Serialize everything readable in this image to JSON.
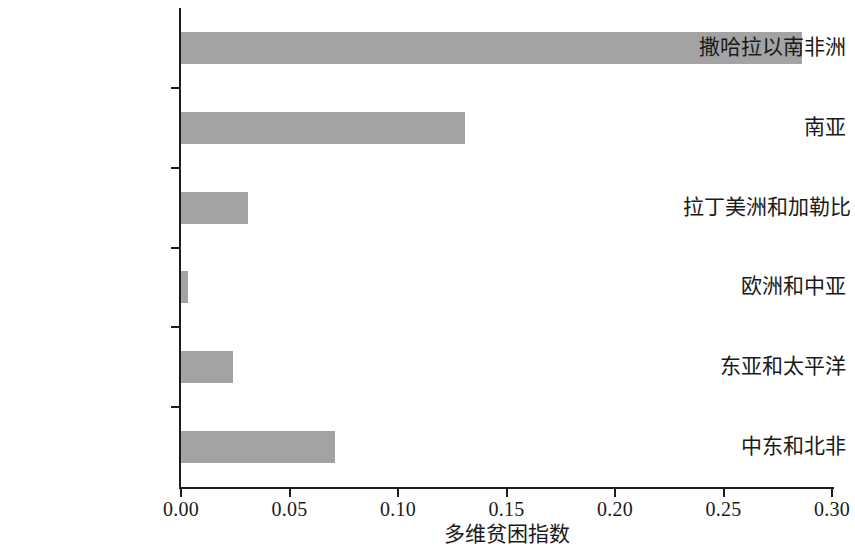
{
  "chart_data": {
    "type": "bar",
    "orientation": "horizontal",
    "title": "",
    "xlabel": "多维贫困指数",
    "ylabel": "",
    "categories": [
      "撒哈拉以南非洲",
      "南亚",
      "拉丁美洲和加勒比",
      "欧洲和中亚",
      "东亚和太平洋",
      "中东和北非"
    ],
    "values": [
      0.286,
      0.131,
      0.031,
      0.003,
      0.024,
      0.071
    ],
    "xlim": [
      0.0,
      0.3
    ],
    "xticks": [
      0.0,
      0.05,
      0.1,
      0.15,
      0.2,
      0.25,
      0.3
    ],
    "xtick_labels": [
      "0.00",
      "0.05",
      "0.10",
      "0.15",
      "0.20",
      "0.25",
      "0.30"
    ],
    "grid": false,
    "legend": null,
    "bar_color": "#a3a3a3",
    "axis_color": "#1d1d1d"
  }
}
